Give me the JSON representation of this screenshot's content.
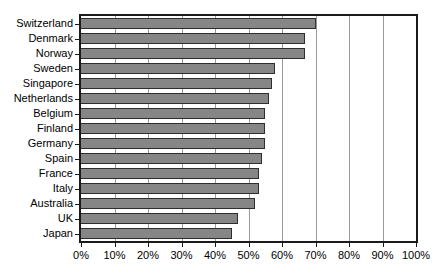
{
  "chart_data": {
    "type": "bar",
    "orientation": "horizontal",
    "title": "",
    "xlabel": "",
    "ylabel": "",
    "categories": [
      "Switzerland",
      "Denmark",
      "Norway",
      "Sweden",
      "Singapore",
      "Netherlands",
      "Belgium",
      "Finland",
      "Germany",
      "Spain",
      "France",
      "Italy",
      "Australia",
      "UK",
      "Japan"
    ],
    "values": [
      70,
      67,
      67,
      58,
      57,
      56,
      55,
      55,
      55,
      54,
      53,
      53,
      52,
      47,
      45
    ],
    "xlim": [
      0,
      100
    ],
    "x_ticks": [
      0,
      10,
      20,
      30,
      40,
      50,
      60,
      70,
      80,
      90,
      100
    ],
    "x_tick_labels": [
      "0%",
      "10%",
      "20%",
      "30%",
      "40%",
      "50%",
      "60%",
      "70%",
      "80%",
      "90%",
      "100%"
    ],
    "grid": "vertical gridlines at each 10% step",
    "legend": "none"
  },
  "style": {
    "background": "#ffffff",
    "bar_fill": "#868686",
    "bar_border": "#2e2e2e",
    "gridline_color": "#9a9a9a",
    "axis_color": "#1a1a1a",
    "text_color": "#000000"
  }
}
